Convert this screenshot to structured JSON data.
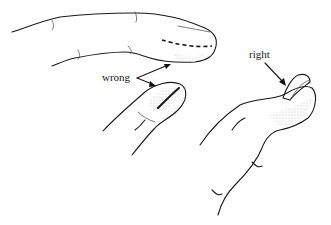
{
  "illustration": {
    "subject": "Fingernail trimming: wrong vs right",
    "labels": {
      "wrong": "wrong",
      "right": "right"
    },
    "colors": {
      "ink": "#1a1a1a",
      "background": "#ffffff",
      "stipple": "#888888"
    }
  }
}
